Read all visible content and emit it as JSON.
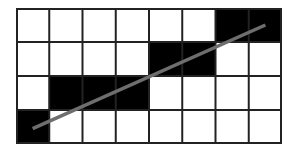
{
  "diagram": {
    "title": "",
    "grid": {
      "columns": 8,
      "rows": 4,
      "filled_cells": [
        {
          "row": 0,
          "col": 6
        },
        {
          "row": 0,
          "col": 7
        },
        {
          "row": 1,
          "col": 4
        },
        {
          "row": 1,
          "col": 5
        },
        {
          "row": 2,
          "col": 1
        },
        {
          "row": 2,
          "col": 2
        },
        {
          "row": 2,
          "col": 3
        },
        {
          "row": 3,
          "col": 0
        }
      ],
      "cell_fill_color": "#000000",
      "empty_cell_color": "#ffffff",
      "grid_line_color": "#222222"
    },
    "line": {
      "start": {
        "x": 0.5,
        "y": 3.55
      },
      "end": {
        "x": 7.5,
        "y": 0.5
      },
      "color": "#6e6e6e"
    }
  }
}
